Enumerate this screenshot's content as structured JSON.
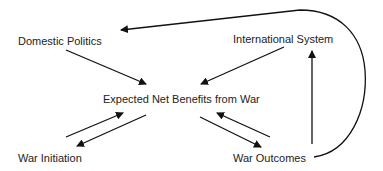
{
  "diagram": {
    "nodes": {
      "domestic_politics": "Domestic Politics",
      "international_system": "International System",
      "expected_net_benefits": "Expected Net Benefits from War",
      "war_initiation": "War Initiation",
      "war_outcomes": "War Outcomes"
    },
    "edges": [
      {
        "from": "Domestic Politics",
        "to": "Expected Net Benefits from War"
      },
      {
        "from": "International System",
        "to": "Expected Net Benefits from War"
      },
      {
        "from": "Expected Net Benefits from War",
        "to": "War Initiation"
      },
      {
        "from": "War Initiation",
        "to": "Expected Net Benefits from War"
      },
      {
        "from": "Expected Net Benefits from War",
        "to": "War Outcomes"
      },
      {
        "from": "War Outcomes",
        "to": "Expected Net Benefits from War"
      },
      {
        "from": "War Outcomes",
        "to": "International System"
      },
      {
        "from": "War Outcomes",
        "to": "Domestic Politics"
      }
    ],
    "colors": {
      "line": "#111111",
      "text": "#222222",
      "background": "#ffffff"
    }
  }
}
